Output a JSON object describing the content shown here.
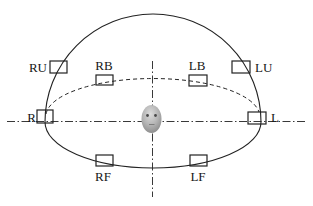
{
  "diagram": {
    "background_color": "#ffffff",
    "line_color": "#222222",
    "label_color": "#161616",
    "speakers": [
      {
        "id": "RU",
        "label": "RU",
        "rect": {
          "x": 50,
          "y": 61,
          "w": 17,
          "h": 12
        },
        "label_x": 47,
        "label_y": 72,
        "anchor": "end"
      },
      {
        "id": "RB",
        "label": "RB",
        "rect": {
          "x": 96,
          "y": 75,
          "w": 17,
          "h": 10
        },
        "label_x": 104,
        "label_y": 70,
        "anchor": "middle"
      },
      {
        "id": "LB",
        "label": "LB",
        "rect": {
          "x": 189,
          "y": 75,
          "w": 18,
          "h": 11
        },
        "label_x": 197,
        "label_y": 70,
        "anchor": "middle"
      },
      {
        "id": "LU",
        "label": "LU",
        "rect": {
          "x": 232,
          "y": 61,
          "w": 18,
          "h": 12
        },
        "label_x": 255,
        "label_y": 72,
        "anchor": "start"
      },
      {
        "id": "R",
        "label": "R",
        "rect": {
          "x": 37,
          "y": 110,
          "w": 16,
          "h": 13
        },
        "label_x": 36,
        "label_y": 122,
        "anchor": "end"
      },
      {
        "id": "L",
        "label": "L",
        "rect": {
          "x": 248,
          "y": 112,
          "w": 18,
          "h": 12
        },
        "label_x": 271,
        "label_y": 122,
        "anchor": "start"
      },
      {
        "id": "RF",
        "label": "RF",
        "rect": {
          "x": 96,
          "y": 155,
          "w": 17,
          "h": 11
        },
        "label_x": 103,
        "label_y": 181,
        "anchor": "middle"
      },
      {
        "id": "LF",
        "label": "LF",
        "rect": {
          "x": 190,
          "y": 155,
          "w": 17,
          "h": 11
        },
        "label_x": 198,
        "label_y": 181,
        "anchor": "middle"
      }
    ],
    "curves": {
      "dome_outline_path": "M 45 122 A 108 108 0 0 1 261 122 A 108 46 0 0 1 45 122",
      "back_rim_dashed_path": "M 46 114 A 107 38 0 0 1 259 112",
      "dash_pattern_rim": "4 3",
      "dash_pattern_axis": "8 2.5 1.5 2.5"
    },
    "axes": {
      "horizontal": {
        "x1": 7,
        "y1": 121.5,
        "x2": 306,
        "y2": 121.5
      },
      "vertical": {
        "x1": 152.5,
        "y1": 61,
        "x2": 152.5,
        "y2": 197
      }
    },
    "head": {
      "cx": 151.5,
      "cy": 119,
      "rx": 10,
      "ry": 14,
      "highlight_color": "#dcdcdc",
      "mid_color": "#b4b4b4",
      "edge_color": "#8a8a8a",
      "eye_color": "#4a4a4a",
      "mouth_color": "#7d7d7d",
      "eyes": [
        {
          "cx": 147.5,
          "cy": 115.5,
          "r": 1.4
        },
        {
          "cx": 155.5,
          "cy": 115.5,
          "r": 1.4
        }
      ],
      "mouth": {
        "x1": 149,
        "y1": 124.5,
        "x2": 154.5,
        "y2": 124.5
      }
    }
  }
}
